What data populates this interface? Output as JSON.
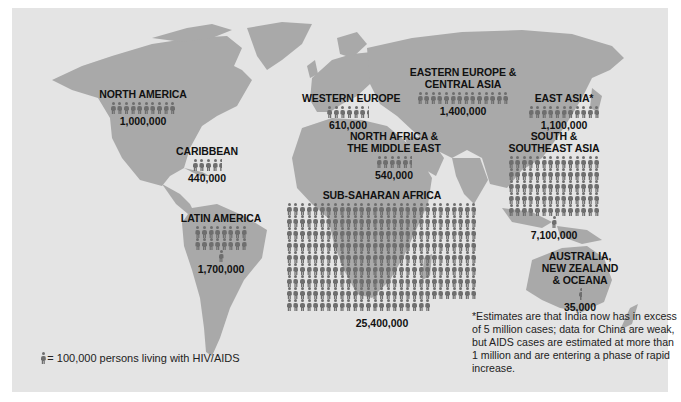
{
  "map": {
    "title": "Persons living with HIV/AIDS by world region",
    "colors": {
      "background": "#e4e4e4",
      "land": "#a9a9a9",
      "figure": "#6e6e6e",
      "text": "#111111"
    },
    "unit_per_figure": 100000,
    "regions": [
      {
        "id": "north-america",
        "name": "NORTH AMERICA",
        "value": "1,000,000",
        "figures": 10
      },
      {
        "id": "caribbean",
        "name": "CARIBBEAN",
        "value": "440,000",
        "figures": 4.4
      },
      {
        "id": "latin-america",
        "name": "LATIN AMERICA",
        "value": "1,700,000",
        "figures": 17
      },
      {
        "id": "western-europe",
        "name": "WESTERN EUROPE",
        "value": "610,000",
        "figures": 6.1
      },
      {
        "id": "eastern-europe-central-asia",
        "name_line1": "EASTERN EUROPE &",
        "name_line2": "CENTRAL ASIA",
        "value": "1,400,000",
        "figures": 14
      },
      {
        "id": "east-asia",
        "name": "EAST ASIA*",
        "value": "1,100,000",
        "figures": 11
      },
      {
        "id": "north-africa-middle-east",
        "name_line1": "NORTH AFRICA &",
        "name_line2": "THE MIDDLE EAST",
        "value": "540,000",
        "figures": 5.4
      },
      {
        "id": "sub-saharan-africa",
        "name": "SUB-SAHARAN AFRICA",
        "value": "25,400,000",
        "figures": 254
      },
      {
        "id": "south-southeast-asia",
        "name_line1": "SOUTH &",
        "name_line2": "SOUTHEAST ASIA",
        "value": "7,100,000",
        "figures": 71
      },
      {
        "id": "australia-nz-oceana",
        "name_line1": "AUSTRALIA,",
        "name_line2": "NEW ZEALAND",
        "name_line3": "& OCEANA",
        "value": "35,000",
        "figures": 0.35
      }
    ],
    "legend": {
      "icon": "person-icon",
      "text": "= 100,000 persons living with HIV/AIDS"
    },
    "footnote": "*Estimates are that India now has in excess of 5 million cases; data for China are weak, but AIDS cases are estimated at more than 1 million and are entering a phase of rapid increase."
  }
}
